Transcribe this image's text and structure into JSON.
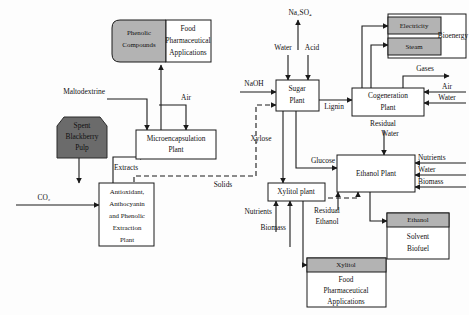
{
  "diagram": {
    "colors": {
      "gray_fill": "#9e9e9e",
      "dark_fill": "#6b6b6b",
      "white_fill": "#ffffff",
      "line": "#1a1a1a"
    },
    "feedstock": {
      "spent_pulp_line1": "Spent",
      "spent_pulp_line2": "Blackberry",
      "spent_pulp_line3": "Pulp"
    },
    "units": {
      "extraction_line1": "Antioxidant,",
      "extraction_line2": "Anthocyanin",
      "extraction_line3": "and Phenolic",
      "extraction_line4": "Extraction",
      "extraction_line5": "Plant",
      "microencapsulation_line1": "Microencapsulation",
      "microencapsulation_line2": "Plant",
      "sugar_plant_line1": "Sugar",
      "sugar_plant_line2": "Plant",
      "cogeneration_line1": "Cogeneration",
      "cogeneration_line2": "Plant",
      "ethanol_plant": "Ethanol Plant",
      "xylitol_plant": "Xylitol plant"
    },
    "products": {
      "phenolic_label": "Phenolic",
      "phenolic_label2": "Compounds",
      "phenolic_app1": "Food",
      "phenolic_app2": "Pharmaceutical",
      "phenolic_app3": "Applications",
      "bioenergy_electricity": "Electricity",
      "bioenergy_steam": "Steam",
      "bioenergy_label": "Bioenergy",
      "xylitol_label": "Xylitol",
      "xylitol_app1": "Food",
      "xylitol_app2": "Pharmaceutical",
      "xylitol_app3": "Applications",
      "ethanol_label": "Ethanol",
      "ethanol_app1": "Solvent",
      "ethanol_app2": "Biofuel"
    },
    "streams": {
      "co2": "CO₂",
      "maltodextrine": "Maltodextrine",
      "air_micro": "Air",
      "extracts": "Extracts",
      "solids": "Solids",
      "naoh": "NaOH",
      "water_sugar": "Water",
      "acid": "Acid",
      "na2so4": "Na₂SO₄",
      "lignin": "Lignin",
      "xylose": "Xylose",
      "glucose": "Glucose",
      "gases": "Gases",
      "air_cogen": "Air",
      "water_cogen": "Water",
      "residual_water_line1": "Residual",
      "residual_water_line2": "Water",
      "nutrients_ethanol": "Nutrients",
      "water_ethanol": "Water",
      "biomass_ethanol": "Biomass",
      "nutrients_xylitol": "Nutrients",
      "biomass_xylitol": "Biomass",
      "residual_ethanol_line1": "Residual",
      "residual_ethanol_line2": "Ethanol"
    }
  }
}
